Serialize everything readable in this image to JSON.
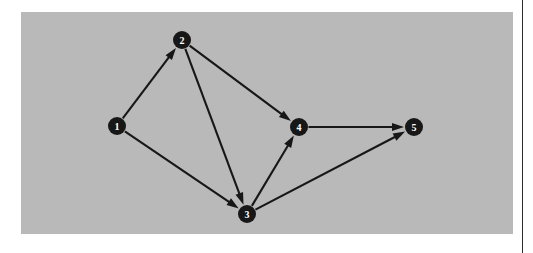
{
  "page": {
    "background_color": "#ffffff",
    "rule_color": "#2b2b2b"
  },
  "figure": {
    "panel_background_color": "#b9b9b9",
    "node_color": "#171717",
    "node_label_color": "#ffffff",
    "edge_color": "#171717"
  },
  "chart_data": {
    "type": "diagram",
    "diagram_kind": "directed-graph",
    "title": "",
    "node_count": 5,
    "edge_count": 7,
    "nodes": [
      {
        "id": "1",
        "label": "1",
        "x": 96,
        "y": 114,
        "r": 9
      },
      {
        "id": "2",
        "label": "2",
        "x": 161,
        "y": 28,
        "r": 9
      },
      {
        "id": "3",
        "label": "3",
        "x": 226,
        "y": 202,
        "r": 9
      },
      {
        "id": "4",
        "label": "4",
        "x": 278,
        "y": 115,
        "r": 9
      },
      {
        "id": "5",
        "label": "5",
        "x": 393,
        "y": 115,
        "r": 9
      }
    ],
    "edges": [
      {
        "from": "1",
        "to": "2",
        "directed": true
      },
      {
        "from": "1",
        "to": "3",
        "directed": true
      },
      {
        "from": "2",
        "to": "3",
        "directed": true
      },
      {
        "from": "2",
        "to": "4",
        "directed": true
      },
      {
        "from": "3",
        "to": "4",
        "directed": true
      },
      {
        "from": "3",
        "to": "5",
        "directed": true
      },
      {
        "from": "4",
        "to": "5",
        "directed": true
      }
    ],
    "adjacency": {
      "1": [
        "2",
        "3"
      ],
      "2": [
        "3",
        "4"
      ],
      "3": [
        "4",
        "5"
      ],
      "4": [
        "5"
      ],
      "5": []
    }
  }
}
